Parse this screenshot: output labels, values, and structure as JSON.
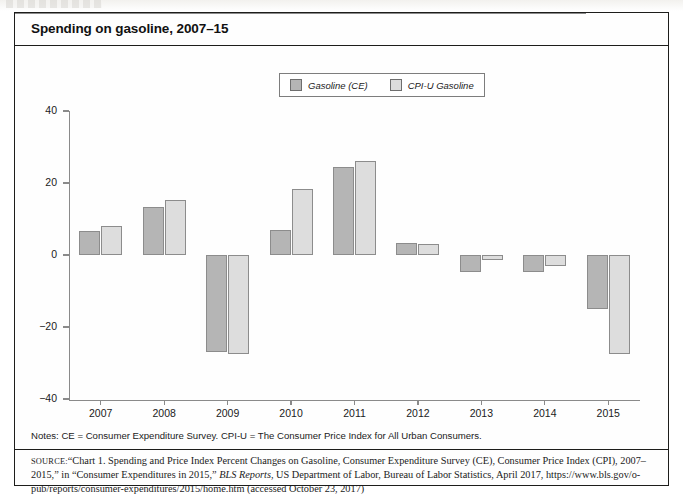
{
  "figure": {
    "title": "Spending on gasoline, 2007–15",
    "notes": "Notes: CE = Consumer Expenditure Survey. CPI-U = The Consumer Price Index for All Urban Consumers.",
    "source_label": "Source:",
    "source_text_1": "“Chart 1. Spending and Price Index Percent Changes on Gasoline, Consumer Expenditure Survey (CE), Consumer Price Index (CPI), 2007–2015,” in “Consumer Expenditures in 2015,” ",
    "source_italic": "BLS Reports",
    "source_text_2": ", US Department of Labor, Bureau of Labor Statistics, April 2017, https://www.bls.gov/o-pub/reports/consumer-expenditures/2015/home.htm (accessed October 23, 2017)"
  },
  "legend": {
    "items": [
      {
        "label": "Gasoline (CE)",
        "color": "#b5b5b5",
        "swatch_name": "legend-swatch-gasoline-ce"
      },
      {
        "label": "CPI-U Gasoline",
        "color": "#dddddd",
        "swatch_name": "legend-swatch-cpi-u-gasoline"
      }
    ]
  },
  "chart_data": {
    "type": "bar",
    "title": "Spending on gasoline, 2007–15",
    "xlabel": "",
    "ylabel": "",
    "categories": [
      "2007",
      "2008",
      "2009",
      "2010",
      "2011",
      "2012",
      "2013",
      "2014",
      "2015"
    ],
    "series": [
      {
        "name": "Gasoline (CE)",
        "color": "#b5b5b5",
        "values": [
          6.6,
          13.3,
          -27.0,
          7.0,
          24.5,
          3.3,
          -4.7,
          -4.7,
          -15.0
        ]
      },
      {
        "name": "CPI-U Gasoline",
        "color": "#dddddd",
        "values": [
          8.0,
          15.2,
          -27.5,
          18.3,
          26.0,
          3.0,
          -1.4,
          -3.0,
          -27.5
        ]
      }
    ],
    "ylim": [
      -40,
      40
    ],
    "yticks": [
      40,
      20,
      0,
      -20,
      -40
    ],
    "ytick_labels": [
      "40",
      "20",
      "0",
      "−20",
      "−40"
    ],
    "grid": false,
    "legend_position": "top-center",
    "zero_line": true
  }
}
